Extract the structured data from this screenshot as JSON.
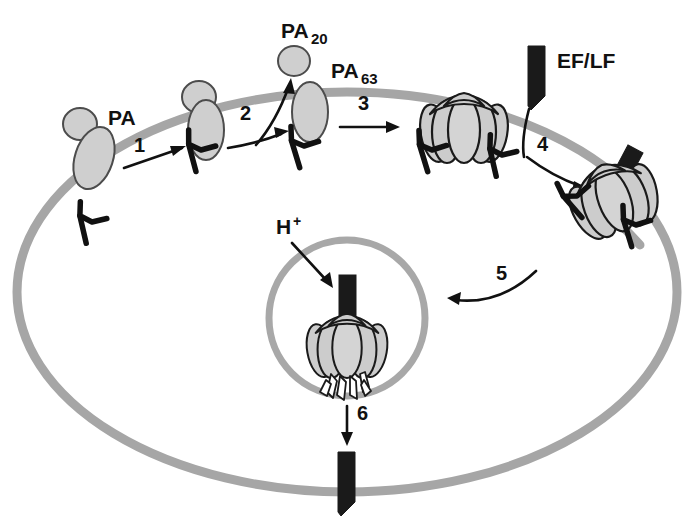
{
  "figure": {
    "domain": "Diagram",
    "type": "biological-pathway-schematic",
    "canvas": {
      "width": 695,
      "height": 528
    },
    "palette": {
      "background": "#ffffff",
      "membrane_gray": "#a6a6a6",
      "protein_fill": "#cfcfcf",
      "protein_outline": "#4c4c4c",
      "heptamer_fill": "#cccccc",
      "heptamer_outline": "#1a1a1a",
      "eflf_black": "#1a1a1a",
      "text_black": "#111111",
      "arrow_black": "#111111"
    }
  },
  "labels": {
    "pa": "PA",
    "pa20_base": "PA",
    "pa20_sub": "20",
    "pa63_base": "PA",
    "pa63_sub": "63",
    "eflf": "EF/LF",
    "proton_base": "H",
    "proton_sup": "+"
  },
  "steps": [
    {
      "id": "1",
      "number": "1",
      "description": "PA binds cell-surface receptor"
    },
    {
      "id": "2",
      "number": "2",
      "description": "Furin cleavage releases PA20, leaving PA63"
    },
    {
      "id": "3",
      "number": "3",
      "description": "PA63 oligomerizes into heptameric prepore"
    },
    {
      "id": "4",
      "number": "4",
      "description": "EF/LF binds the prepore complex"
    },
    {
      "id": "5",
      "number": "5",
      "description": "Receptor-mediated endocytosis into endosome"
    },
    {
      "id": "6",
      "number": "6",
      "description": "Acidification drives pore formation and EF/LF translocation to cytosol"
    }
  ],
  "structures": {
    "cell_membrane": "large outer ellipse representing the plasma membrane",
    "endosome": "small circle inside the cell representing the acidified endosome",
    "receptors": "Y-shaped black transmembrane receptors",
    "pa_monomer": "small circle (PA20 domain) fused to an elongated oval (PA63 domain)",
    "pa63_monomer": "elongated gray oval bound to receptor",
    "heptamer": "multi-lobed pumpkin-shaped gray prepore ring",
    "pore": "heptamer with extended beta-barrel legs protruding through endosomal membrane",
    "eflf_wedge": "solid black wedge/dagger representing edema factor / lethal factor"
  }
}
